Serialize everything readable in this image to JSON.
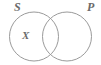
{
  "figure": {
    "type": "venn-diagram",
    "width": 101,
    "height": 65,
    "background_color": "#ffffff",
    "stroke_color": "#9a9a9a",
    "label_color": "#6b6b6b"
  },
  "sets": {
    "left": {
      "label": "S",
      "cx": 34,
      "cy": 36.5,
      "r": 24.5,
      "label_position": "outside-top-left"
    },
    "right": {
      "label": "P",
      "cx": 67,
      "cy": 36.5,
      "r": 24.5,
      "label_position": "outside-top-right"
    }
  },
  "markers": [
    {
      "label": "X",
      "region": "left-only",
      "x": 26,
      "y": 36
    }
  ]
}
